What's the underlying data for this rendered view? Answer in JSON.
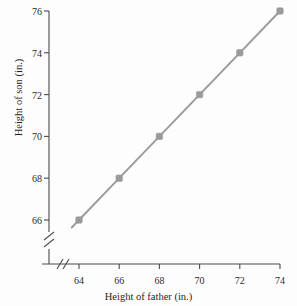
{
  "chart_data": {
    "type": "line",
    "title": "",
    "xlabel": "Height of father (in.)",
    "ylabel": "Height of son (in.)",
    "x": [
      64,
      66,
      68,
      70,
      72,
      74
    ],
    "values": [
      66,
      68,
      70,
      72,
      74,
      76
    ],
    "series": [
      {
        "name": "Height of son vs. height of father",
        "x": [
          64,
          66,
          68,
          70,
          72,
          74
        ],
        "values": [
          66,
          68,
          70,
          72,
          74,
          76
        ]
      }
    ],
    "xlim": [
      63.2,
      74
    ],
    "ylim": [
      65.3,
      76
    ],
    "xticks": [
      64,
      66,
      68,
      70,
      72,
      74
    ],
    "yticks": [
      66,
      68,
      70,
      72,
      74,
      76
    ],
    "xtick_labels": [
      "64",
      "66",
      "68",
      "70",
      "72",
      "74"
    ],
    "ytick_labels": [
      "66",
      "68",
      "70",
      "72",
      "74",
      "76"
    ],
    "grid": false,
    "legend": "none",
    "axis_break_x": true,
    "axis_break_y": true,
    "marker": "square",
    "line_color": "#9a9a9a",
    "marker_color": "#9a9a9a",
    "axis_color": "#4a4a4a",
    "background": "#fdfdfd"
  }
}
